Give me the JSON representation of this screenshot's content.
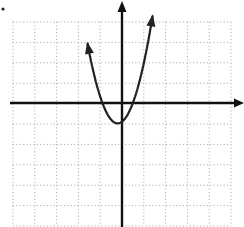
{
  "figure": {
    "bullet_marker": "•"
  },
  "grid": {
    "columns": 10,
    "rows": 10,
    "style": "dotted",
    "color": "#9a9a9a",
    "x_range": [
      -5,
      5
    ],
    "y_range": [
      -6,
      4
    ]
  },
  "axes": {
    "color": "#111111",
    "x_axis_arrow": "right",
    "y_axis_arrow": "up"
  },
  "curve": {
    "type": "parabola",
    "equation_estimate": "y = 2x^2 - 1",
    "vertex": [
      -0.2,
      -1
    ],
    "color": "#222222",
    "arrows_at_ends": true
  },
  "chart_data": {
    "type": "line",
    "title": "",
    "xlabel": "",
    "ylabel": "",
    "grid": true,
    "xlim": [
      -5,
      5
    ],
    "ylim": [
      -6,
      4
    ],
    "series": [
      {
        "name": "parabola",
        "x": [
          -1.6,
          -1.2,
          -0.8,
          -0.4,
          -0.2,
          0,
          0.4,
          0.8,
          1.2,
          1.4
        ],
        "y": [
          3.7,
          1.9,
          0.3,
          -0.7,
          -1.0,
          -0.9,
          -0.3,
          0.7,
          2.3,
          3.7
        ]
      }
    ]
  }
}
